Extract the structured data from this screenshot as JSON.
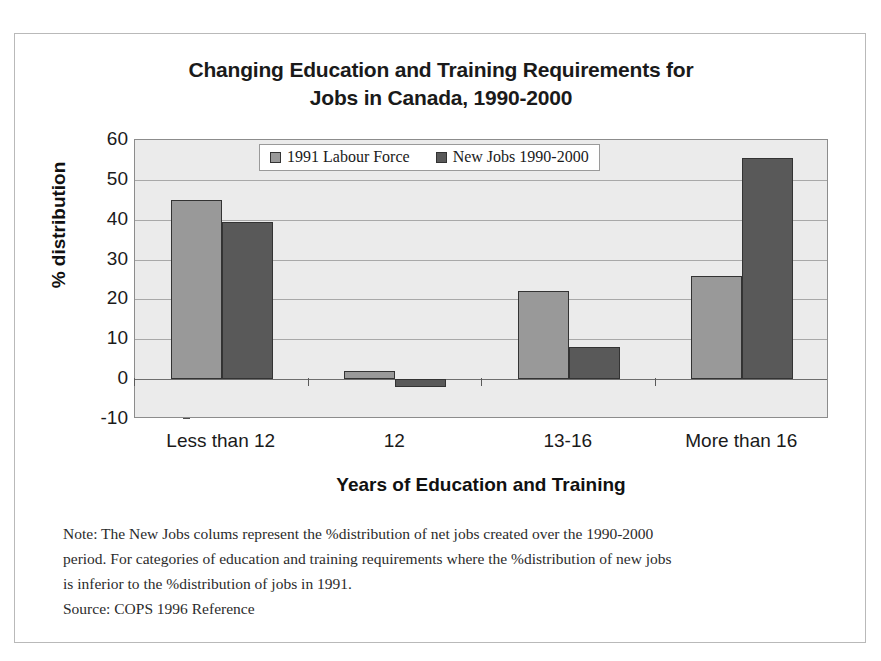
{
  "chart_data": {
    "type": "bar",
    "title": "Changing Education and Training Requirements for Jobs in Canada, 1990-2000",
    "title_lines": [
      "Changing Education and Training Requirements for",
      "Jobs in Canada, 1990-2000"
    ],
    "xlabel": "Years of Education and Training",
    "ylabel": "% distribution",
    "categories": [
      "Less than 12",
      "12",
      "13-16",
      "More than 16"
    ],
    "series": [
      {
        "name": "1991 Labour Force",
        "color": "#999999",
        "values": [
          45,
          2,
          22,
          26
        ]
      },
      {
        "name": "New Jobs 1990-2000",
        "color": "#595959",
        "values": [
          39.5,
          -2,
          8,
          55.5
        ]
      }
    ],
    "ylim": [
      -10,
      60
    ],
    "ytick_step": 10,
    "yticks": [
      60,
      50,
      40,
      30,
      20,
      10,
      0,
      -10
    ],
    "ytick_labels": [
      "60",
      "50",
      "40",
      "30",
      "20",
      "10",
      "0",
      "-10"
    ],
    "grid": true,
    "legend_position": "top-center",
    "plot_background": "#ebebeb"
  },
  "footnote": {
    "lines": [
      "Note: The New Jobs colums represent the %distribution of net jobs created over the 1990-2000",
      "period. For categories of education and training requirements where the %distribution of new jobs",
      "is inferior to the %distribution of jobs in 1991.",
      "Source: COPS 1996 Reference"
    ]
  }
}
